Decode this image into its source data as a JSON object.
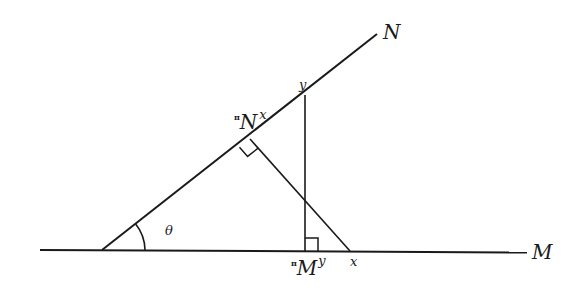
{
  "diagram": {
    "type": "geometric projection diagram",
    "colors": {
      "line": "#1a1a1a",
      "background": "#ffffff"
    },
    "lines": {
      "M": {
        "label": "M"
      },
      "N": {
        "label": "N"
      }
    },
    "angle": {
      "label": "θ"
    },
    "points": {
      "y_on_N": {
        "label": "y"
      },
      "x_on_M": {
        "label": "x"
      },
      "proj_N_x": {
        "pi": "π",
        "base": "N",
        "sup": "x"
      },
      "proj_M_y": {
        "pi": "π",
        "base": "M",
        "sup": "y"
      }
    }
  }
}
